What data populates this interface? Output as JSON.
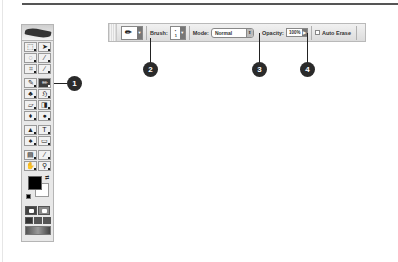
{
  "options_bar": {
    "tool_preset_icon": "pencil-icon",
    "brush_label": "Brush:",
    "brush_value": "1",
    "mode_label": "Mode:",
    "mode_value": "Normal",
    "opacity_label": "Opacity:",
    "opacity_value": "100%",
    "auto_erase_label": "Auto Erase",
    "auto_erase_checked": false
  },
  "callouts": [
    "1",
    "2",
    "3",
    "4"
  ],
  "toolbox": {
    "tools": [
      {
        "name": "marquee-tool",
        "glyph": "⬚"
      },
      {
        "name": "move-tool",
        "glyph": "➤"
      },
      {
        "name": "lasso-tool",
        "glyph": "◌"
      },
      {
        "name": "magic-wand-tool",
        "glyph": "⁄"
      },
      {
        "name": "crop-tool",
        "glyph": "⌗"
      },
      {
        "name": "slice-tool",
        "glyph": "∕"
      },
      {
        "name": "healing-brush-tool",
        "glyph": "✎"
      },
      {
        "name": "pencil-tool",
        "glyph": "✏"
      },
      {
        "name": "clone-stamp-tool",
        "glyph": "♣"
      },
      {
        "name": "history-brush-tool",
        "glyph": "ℌ"
      },
      {
        "name": "eraser-tool",
        "glyph": "▱"
      },
      {
        "name": "gradient-tool",
        "glyph": "◨"
      },
      {
        "name": "blur-tool",
        "glyph": "♦"
      },
      {
        "name": "dodge-tool",
        "glyph": "●"
      },
      {
        "name": "path-selection-tool",
        "glyph": "▲"
      },
      {
        "name": "type-tool",
        "glyph": "T"
      },
      {
        "name": "pen-tool",
        "glyph": "♠"
      },
      {
        "name": "shape-tool",
        "glyph": "▭"
      },
      {
        "name": "notes-tool",
        "glyph": "▤"
      },
      {
        "name": "eyedropper-tool",
        "glyph": "⁄"
      },
      {
        "name": "hand-tool",
        "glyph": "✋"
      },
      {
        "name": "zoom-tool",
        "glyph": "⚲"
      }
    ],
    "foreground_color": "#000000",
    "background_color": "#ffffff"
  }
}
